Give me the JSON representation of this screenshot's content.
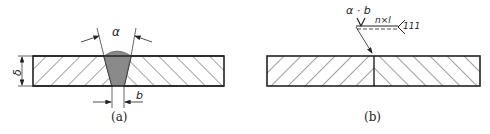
{
  "figure_a": {
    "caption": "(a)",
    "angle_label": "α",
    "gap_label": "b",
    "thickness_label": "δ"
  },
  "figure_b": {
    "caption": "(b)",
    "symbol_top_label": "α · b",
    "length_label": "n×l",
    "process_number": "111"
  },
  "colors": {
    "line": "#222222",
    "weld_fill": "#8a8a8a",
    "background": "#ffffff"
  }
}
